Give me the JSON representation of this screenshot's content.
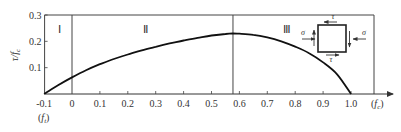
{
  "chart_data": {
    "type": "line",
    "title": "",
    "xlabel": "(f_t)",
    "xlabel_left": "(f_t)",
    "xlabel_right": "(f_c)",
    "ylabel": "τ/f_c",
    "xlim": [
      -0.1,
      1.1
    ],
    "ylim": [
      0,
      0.3
    ],
    "grid": false,
    "x_ticks": [
      "-0.1",
      "0",
      "0.1",
      "0.2",
      "0.3",
      "0.4",
      "0.5",
      "0.6",
      "0.7",
      "0.8",
      "0.9",
      "1.0"
    ],
    "y_ticks": [
      "0.1",
      "0.2",
      "0.3"
    ],
    "regions": [
      {
        "label": "Ⅰ",
        "x_range": [
          -0.1,
          0
        ]
      },
      {
        "label": "Ⅱ",
        "x_range": [
          0,
          0.577
        ]
      },
      {
        "label": "Ⅲ",
        "x_range": [
          0.577,
          1.1
        ]
      }
    ],
    "region_dividers_x": [
      0,
      0.577
    ],
    "series": [
      {
        "name": "failure envelope",
        "x": [
          -0.1,
          -0.05,
          0,
          0.05,
          0.1,
          0.15,
          0.2,
          0.25,
          0.3,
          0.35,
          0.4,
          0.45,
          0.5,
          0.55,
          0.577,
          0.6,
          0.65,
          0.7,
          0.75,
          0.8,
          0.85,
          0.9,
          0.95,
          1.0
        ],
        "y": [
          0,
          0.033,
          0.063,
          0.09,
          0.113,
          0.133,
          0.15,
          0.166,
          0.179,
          0.192,
          0.203,
          0.213,
          0.222,
          0.228,
          0.23,
          0.229,
          0.225,
          0.215,
          0.2,
          0.18,
          0.155,
          0.12,
          0.075,
          0
        ]
      }
    ],
    "annotations": [
      {
        "type": "stress-element",
        "labels": {
          "shear": "τ",
          "normal": "σ"
        }
      }
    ]
  },
  "labels": {
    "y_axis": "τ/f",
    "y_axis_sub": "c",
    "x_left_paren_open": "(",
    "x_left_var": "f",
    "x_left_sub": "t",
    "x_left_paren_close": ")",
    "x_right_paren_open": "(",
    "x_right_var": "f",
    "x_right_sub": "c",
    "x_right_paren_close": ")",
    "tau": "τ",
    "sigma": "σ"
  }
}
